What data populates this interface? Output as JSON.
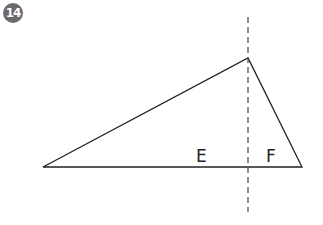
{
  "badge": {
    "number": "14",
    "color": "#6b6b6b"
  },
  "diagram": {
    "triangle": {
      "vertices": [
        [
          43,
          167
        ],
        [
          248,
          58
        ],
        [
          302,
          167
        ]
      ],
      "stroke": "#222222"
    },
    "dashed_line": {
      "x": 248,
      "y1": 17,
      "y2": 212,
      "stroke": "#555555"
    },
    "regions": [
      {
        "label": "E",
        "x": 196,
        "y": 146
      },
      {
        "label": "F",
        "x": 266,
        "y": 146
      }
    ]
  }
}
